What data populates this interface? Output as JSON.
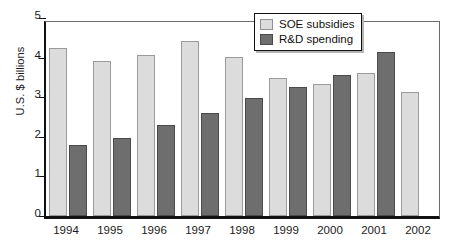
{
  "chart_data": {
    "type": "bar",
    "title": "",
    "subtitle": "",
    "xlabel": "",
    "ylabel": "U.S. $ billions",
    "categories": [
      "1994",
      "1995",
      "1996",
      "1997",
      "1998",
      "1999",
      "2000",
      "2001",
      "2002"
    ],
    "series": [
      {
        "name": "SOE subsidies",
        "color": "#dcdcdc",
        "values": [
          4.25,
          3.91,
          4.07,
          4.42,
          4.01,
          3.49,
          3.34,
          3.61,
          3.13
        ]
      },
      {
        "name": "R&D spending",
        "color": "#6e6e6e",
        "values": [
          1.79,
          1.97,
          2.3,
          2.6,
          2.98,
          3.26,
          3.56,
          4.14,
          null
        ]
      }
    ],
    "ylim": [
      0,
      5
    ],
    "yticks": [
      0,
      1,
      2,
      3,
      4,
      5
    ],
    "ytick_labels": [
      "0",
      "1",
      "2",
      "3",
      "4",
      "5"
    ],
    "grid": false,
    "legend_position": "top-right"
  },
  "legend": {
    "items": [
      {
        "label": "SOE subsidies",
        "swatch": "soe"
      },
      {
        "label": "R&D spending",
        "swatch": "rnd"
      }
    ]
  }
}
